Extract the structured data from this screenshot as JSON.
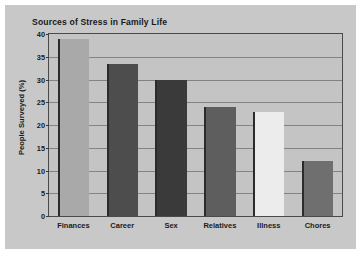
{
  "chart_data": {
    "type": "bar",
    "title": "Sources of Stress in Family Life",
    "xlabel": "",
    "ylabel": "People Surveyed (%)",
    "categories": [
      "Finances",
      "Career",
      "Sex",
      "Relatives",
      "Illness",
      "Chores"
    ],
    "values": [
      39,
      33.5,
      30,
      24,
      22.8,
      12
    ],
    "ylim": [
      0,
      40
    ],
    "yticks": [
      0,
      5,
      10,
      15,
      20,
      25,
      30,
      35,
      40
    ],
    "ytick_labels": [
      "0",
      "5",
      "10",
      "15",
      "20",
      "25",
      "30",
      "35",
      "40"
    ],
    "grid": true,
    "legend": false,
    "bar_colors": [
      "#a9a9a9",
      "#4d4d4d",
      "#3a3a3a",
      "#5e5e5e",
      "#ececec",
      "#6f6f6f"
    ],
    "figure_background": "#c8c8c8",
    "plot_background": "#c4c4c4",
    "gridline_color": "#6e6e6e",
    "frame_color": "#4a4a4a",
    "text_color": "#1a1a1a"
  }
}
